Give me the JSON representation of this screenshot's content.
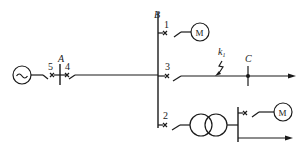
{
  "diagram": {
    "type": "power-system-single-line",
    "buses": [
      {
        "id": "A",
        "label": "A"
      },
      {
        "id": "B",
        "label": "B"
      },
      {
        "id": "C",
        "label": "C"
      }
    ],
    "breakers": [
      {
        "id": "1",
        "label": "1"
      },
      {
        "id": "2",
        "label": "2"
      },
      {
        "id": "3",
        "label": "3"
      },
      {
        "id": "4",
        "label": "4"
      },
      {
        "id": "5",
        "label": "5"
      }
    ],
    "fault": {
      "label": "k",
      "subscript": "1"
    },
    "generator": {
      "symbol": "~"
    },
    "motors": [
      {
        "id": "motor-1",
        "label": "M"
      },
      {
        "id": "motor-2",
        "label": "M"
      }
    ],
    "transformer": {
      "id": "transformer-1"
    }
  }
}
